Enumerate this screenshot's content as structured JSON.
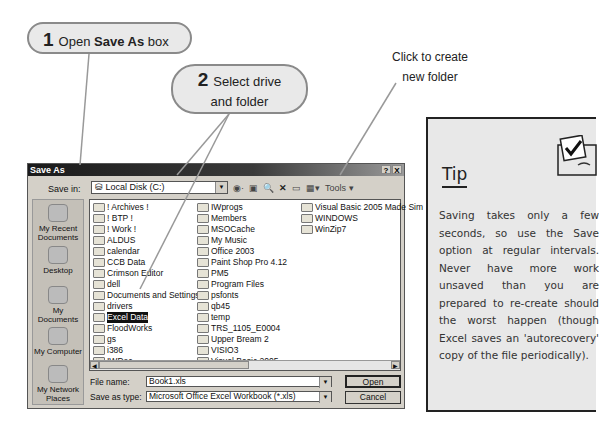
{
  "callouts": {
    "step1": {
      "number": "1",
      "text_pre": "Open ",
      "text_bold": "Save As",
      "text_post": " box"
    },
    "step2": {
      "number": "2",
      "line1": "Select drive",
      "line2": "and folder"
    },
    "note": {
      "line1": "Click to create",
      "line2": "new folder"
    }
  },
  "dialog": {
    "title": "Save As",
    "help_button": "?",
    "close_button": "X",
    "save_in_label": "Save in:",
    "save_in_value": "Local Disk (C:)",
    "toolbar": {
      "back": "back-icon",
      "up": "up-folder-icon",
      "search": "search-web-icon",
      "delete": "delete-icon",
      "new_folder": "new-folder-icon",
      "views": "views-icon",
      "tools_label": "Tools"
    },
    "places": [
      {
        "label_line1": "My Recent",
        "label_line2": "Documents",
        "icon": "recent-docs-icon"
      },
      {
        "label_line1": "Desktop",
        "label_line2": "",
        "icon": "desktop-icon"
      },
      {
        "label_line1": "My Documents",
        "label_line2": "",
        "icon": "my-documents-icon"
      },
      {
        "label_line1": "My Computer",
        "label_line2": "",
        "icon": "my-computer-icon"
      },
      {
        "label_line1": "My Network",
        "label_line2": "Places",
        "icon": "network-places-icon"
      }
    ],
    "columns": [
      [
        "! Archives !",
        "! BTP !",
        "! Work !",
        "ALDUS",
        "calendar",
        "CCB Data",
        "Crimson Editor",
        "dell",
        "Documents and Settings",
        "drivers",
        "Excel Data",
        "FloodWorks",
        "gs",
        "i386",
        "IWDoc"
      ],
      [
        "IWprogs",
        "Members",
        "MSOCache",
        "My Music",
        "Office 2003",
        "Paint Shop Pro 4.12",
        "PM5",
        "Program Files",
        "psfonts",
        "qb45",
        "temp",
        "TRS_1105_E0004",
        "Upper Bream 2",
        "VISIO3",
        "Visual Basic 2005"
      ],
      [
        "Visual Basic 2005 Made Sim",
        "WINDOWS",
        "WinZip7"
      ]
    ],
    "selected_folder": "Excel Data",
    "file_name_label": "File name:",
    "file_name_value": "Book1.xls",
    "save_type_label": "Save as type:",
    "save_type_value": "Microsoft Office Excel Workbook (*.xls)",
    "open_button": "Open",
    "cancel_button": "Cancel"
  },
  "tip": {
    "title": "Tip",
    "text": "Saving takes only a few seconds, so use the Save option at regular intervals. Never have more work unsaved than you are prepared to re-create should the worst happen (though Excel saves an 'autorecovery' copy of the file periodically)."
  }
}
